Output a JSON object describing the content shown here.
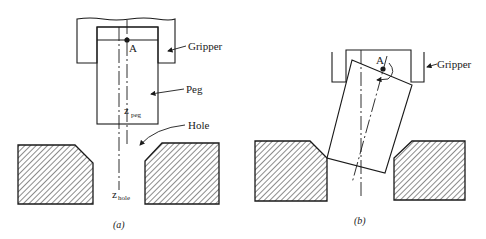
{
  "figure": {
    "panel_a": {
      "caption": "(a)",
      "labels": {
        "point": "A",
        "gripper": "Gripper",
        "peg": "Peg",
        "hole": "Hole",
        "z_peg_main": "z",
        "z_peg_sub": "peg",
        "z_hole_main": "z",
        "z_hole_sub": "hole"
      }
    },
    "panel_b": {
      "caption": "(b)",
      "labels": {
        "point": "A",
        "gripper": "Gripper"
      }
    }
  },
  "colors": {
    "line": "#1a1a1a",
    "background": "#ffffff"
  }
}
